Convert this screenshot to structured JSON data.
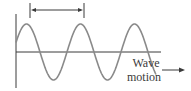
{
  "diagram": {
    "type": "transverse-wave",
    "label_line1": "Wave",
    "label_line2": "motion",
    "wavelength_marker": "double-headed arrow spanning one wavelength (crest to crest)",
    "colors": {
      "wave": "#8a8a8a",
      "axis": "#3a3a3a",
      "arrow": "#3a3a3a",
      "text": "#3a3a3a"
    },
    "wave": {
      "cycles": 2.6,
      "period_px": 54,
      "amplitude_px": 28,
      "baseline_y": 52
    }
  }
}
